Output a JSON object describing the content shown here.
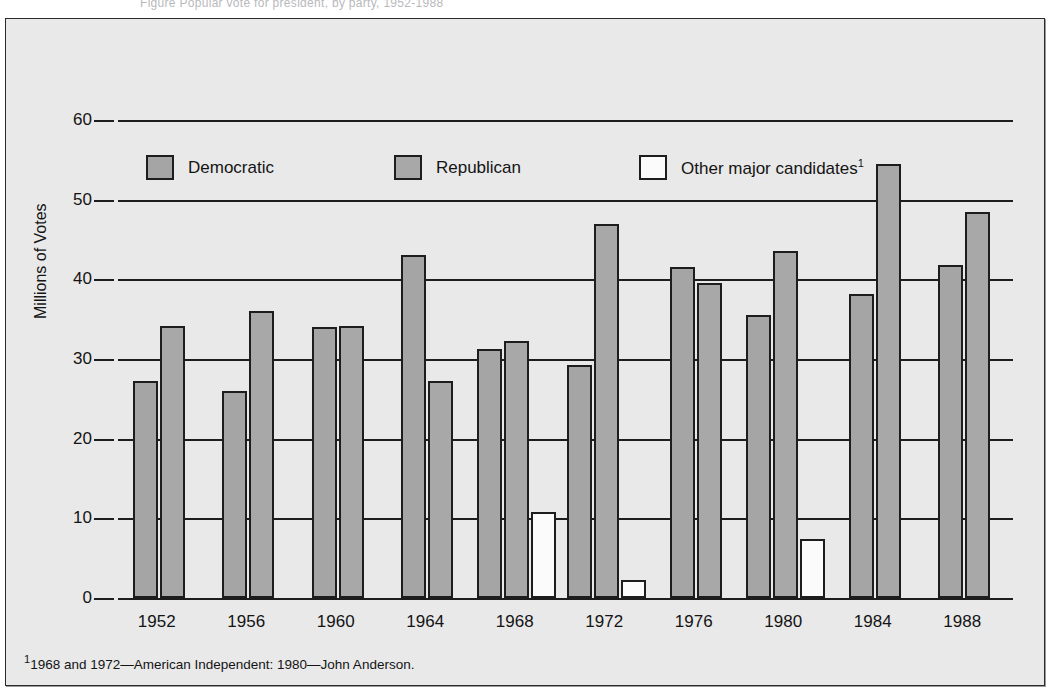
{
  "top_caption": {
    "text": "Figure   Popular vote for president, by party, 1952-1988"
  },
  "legend": {
    "items": [
      {
        "key": "dem",
        "label": "Democratic",
        "color": "#a5a5a5",
        "superscript": ""
      },
      {
        "key": "rep",
        "label": "Republican",
        "color": "#a8a8a8",
        "superscript": ""
      },
      {
        "key": "other",
        "label": "Other major candidates",
        "color": "#fbfbfb",
        "superscript": "1"
      }
    ]
  },
  "axes": {
    "y_title": "Millions of Votes",
    "y_ticks": [
      "0",
      "10",
      "20",
      "30",
      "40",
      "50",
      "60"
    ]
  },
  "footnote": {
    "marker": "1",
    "text": "1968 and 1972—American Independent:  1980—John Anderson."
  },
  "chart_data": {
    "type": "bar",
    "title": "",
    "xlabel": "",
    "ylabel": "Millions of Votes",
    "ylim": [
      0,
      60
    ],
    "ytick_step": 10,
    "grid": true,
    "legend_position": "top-inside",
    "categories": [
      "1952",
      "1956",
      "1960",
      "1964",
      "1968",
      "1972",
      "1976",
      "1980",
      "1984",
      "1988"
    ],
    "series": [
      {
        "name": "Democratic",
        "color": "#a5a5a5",
        "values": [
          27.3,
          26.0,
          34.0,
          43.1,
          31.3,
          29.2,
          41.5,
          35.5,
          38.2,
          41.8
        ]
      },
      {
        "name": "Republican",
        "color": "#a8a8a8",
        "values": [
          34.1,
          36.0,
          34.1,
          27.2,
          32.3,
          47.0,
          39.5,
          43.5,
          54.5,
          48.4
        ]
      },
      {
        "name": "Other major candidates",
        "color": "#fbfbfb",
        "values": [
          0,
          0,
          0,
          0,
          10.8,
          2.3,
          0,
          7.4,
          0,
          0
        ]
      }
    ]
  }
}
